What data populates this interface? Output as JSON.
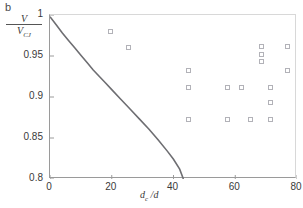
{
  "panel": {
    "label": "b"
  },
  "axes": {
    "ylabel_numerator": "V",
    "ylabel_denominator": "V",
    "ylabel_denominator_sub": "CJ",
    "xlabel_main": "d",
    "xlabel_sub": "c",
    "xlabel_tail": " /d"
  },
  "colors": {
    "marker_stroke": "#b2b2b8",
    "curve": "#6e6e72",
    "axis": "#9a9a9a",
    "frame": "#d8d8d8",
    "text": "#3a3a3a"
  },
  "chart_data": {
    "type": "scatter",
    "title": "b",
    "xlabel": "d_c /d",
    "ylabel": "V/V_CJ",
    "xlim": [
      0,
      80
    ],
    "ylim": [
      0.8,
      1.0
    ],
    "xticks": [
      0,
      20,
      40,
      60,
      80
    ],
    "yticks": [
      0.8,
      0.85,
      0.9,
      0.95,
      1
    ],
    "ytick_labels": [
      "0.8",
      "0.85",
      "0.9",
      "0.95",
      "1"
    ],
    "xtick_labels": [
      "0",
      "20",
      "40",
      "60",
      "80"
    ],
    "grid": false,
    "legend": "none",
    "series": [
      {
        "name": "experimental data",
        "marker": "open-square",
        "points": [
          {
            "x": 19.5,
            "y": 0.98
          },
          {
            "x": 25.5,
            "y": 0.96
          },
          {
            "x": 45.0,
            "y": 0.932
          },
          {
            "x": 45.0,
            "y": 0.912
          },
          {
            "x": 45.0,
            "y": 0.872
          },
          {
            "x": 57.5,
            "y": 0.912
          },
          {
            "x": 57.5,
            "y": 0.872
          },
          {
            "x": 62.0,
            "y": 0.912
          },
          {
            "x": 65.0,
            "y": 0.872
          },
          {
            "x": 68.5,
            "y": 0.962
          },
          {
            "x": 68.5,
            "y": 0.952
          },
          {
            "x": 68.5,
            "y": 0.943
          },
          {
            "x": 71.5,
            "y": 0.912
          },
          {
            "x": 71.5,
            "y": 0.893
          },
          {
            "x": 71.5,
            "y": 0.872
          },
          {
            "x": 77.0,
            "y": 0.962
          },
          {
            "x": 77.0,
            "y": 0.932
          }
        ]
      },
      {
        "name": "model curve",
        "marker": "none",
        "style": "solid-line",
        "points": [
          {
            "x": 0.0,
            "y": 0.998
          },
          {
            "x": 2.0,
            "y": 0.988
          },
          {
            "x": 4.0,
            "y": 0.978
          },
          {
            "x": 6.0,
            "y": 0.969
          },
          {
            "x": 8.0,
            "y": 0.96
          },
          {
            "x": 10.0,
            "y": 0.951
          },
          {
            "x": 12.0,
            "y": 0.942
          },
          {
            "x": 14.0,
            "y": 0.933
          },
          {
            "x": 16.0,
            "y": 0.925
          },
          {
            "x": 18.0,
            "y": 0.917
          },
          {
            "x": 20.0,
            "y": 0.909
          },
          {
            "x": 23.0,
            "y": 0.897
          },
          {
            "x": 26.0,
            "y": 0.885
          },
          {
            "x": 29.0,
            "y": 0.873
          },
          {
            "x": 32.0,
            "y": 0.861
          },
          {
            "x": 35.0,
            "y": 0.848
          },
          {
            "x": 38.0,
            "y": 0.834
          },
          {
            "x": 40.0,
            "y": 0.824
          },
          {
            "x": 42.0,
            "y": 0.812
          },
          {
            "x": 43.2,
            "y": 0.8
          }
        ]
      }
    ]
  }
}
